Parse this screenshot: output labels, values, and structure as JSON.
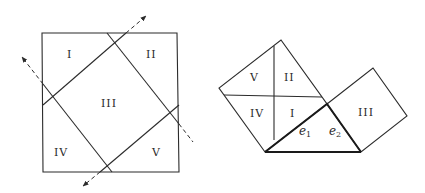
{
  "figure": {
    "left": {
      "description": "Square dissected by two pairs of perpendicular lines into regions I-V",
      "regions": [
        {
          "id": "I",
          "label": "I"
        },
        {
          "id": "II",
          "label": "II"
        },
        {
          "id": "III",
          "label": "III"
        },
        {
          "id": "IV",
          "label": "IV"
        },
        {
          "id": "V",
          "label": "V"
        }
      ]
    },
    "right": {
      "description": "Pieces rearranged on legs of a right triangle with legs e1, e2",
      "regions": [
        {
          "id": "V",
          "label": "V"
        },
        {
          "id": "II",
          "label": "II"
        },
        {
          "id": "IV",
          "label": "IV"
        },
        {
          "id": "I",
          "label": "I"
        },
        {
          "id": "III",
          "label": "III"
        }
      ],
      "edges": [
        {
          "id": "e1",
          "base": "e",
          "sub": "1"
        },
        {
          "id": "e2",
          "base": "e",
          "sub": "2"
        }
      ]
    }
  }
}
